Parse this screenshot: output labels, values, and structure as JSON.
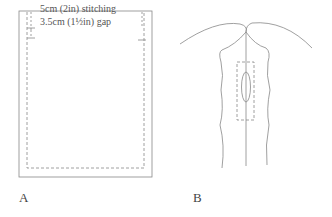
{
  "figure_a": {
    "label": "A",
    "annotation_stitching": "5cm (2in) stitching",
    "annotation_gap": "3.5cm (1½in) gap"
  },
  "figure_b": {
    "label": "B"
  },
  "colors": {
    "line": "#777777",
    "text": "#444444"
  }
}
